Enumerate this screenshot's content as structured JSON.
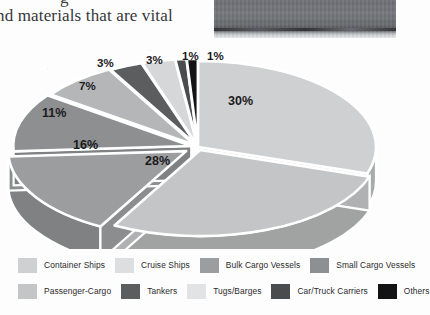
{
  "document": {
    "clipped_line_above": "g",
    "body_line": "nd materials that are vital"
  },
  "photo": {
    "alt_name": "grayscale-seascape-photo-fragment"
  },
  "chart_data": {
    "type": "pie",
    "title": "",
    "exploded": true,
    "three_d": true,
    "legend_position": "bottom",
    "categories": [
      "Container Ships",
      "Cruise Ships",
      "Bulk Cargo Vessels",
      "Small Cargo Vessels",
      "Passenger-Cargo",
      "Tankers",
      "Tugs/Barges",
      "Car/Truck Carriers",
      "Others"
    ],
    "values": [
      30,
      28,
      16,
      11,
      7,
      3,
      3,
      1,
      1
    ],
    "labels": [
      "30%",
      "28%",
      "16%",
      "11%",
      "7%",
      "3%",
      "3%",
      "1%",
      "1%"
    ],
    "colors": [
      "#cfd0d1",
      "#c4c5c6",
      "#9b9d9f",
      "#8d8f91",
      "#b4b6b8",
      "#5b5d5f",
      "#d6d7d8",
      "#4a4c4e",
      "#131315"
    ]
  },
  "legend": {
    "row1": [
      {
        "label": "Container Ships",
        "color": "#cfd0d1"
      },
      {
        "label": "Cruise Ships",
        "color": "#dddedf"
      },
      {
        "label": "Bulk Cargo Vessels",
        "color": "#9b9d9f"
      },
      {
        "label": "Small Cargo Vessels",
        "color": "#8d8f91"
      }
    ],
    "row2": [
      {
        "label": "Passenger-Cargo",
        "color": "#c4c5c6"
      },
      {
        "label": "Tankers",
        "color": "#5b5d5f"
      },
      {
        "label": "Tugs/Barges",
        "color": "#e2e3e4"
      },
      {
        "label": "Car/Truck Carriers",
        "color": "#4a4c4e"
      },
      {
        "label": "Others",
        "color": "#131315"
      }
    ]
  },
  "slice_label_positions": [
    {
      "text": "30%",
      "left": 228,
      "top": 50
    },
    {
      "text": "28%",
      "left": 145,
      "top": 110
    },
    {
      "text": "16%",
      "left": 73,
      "top": 94
    },
    {
      "text": "11%",
      "left": 42,
      "top": 62
    },
    {
      "text": "7%",
      "left": 79,
      "top": 36
    },
    {
      "text": "3%",
      "left": 97,
      "top": 13
    },
    {
      "text": "3%",
      "left": 146,
      "top": 10
    },
    {
      "text": "1%",
      "left": 182,
      "top": 6
    },
    {
      "text": "1%",
      "left": 207,
      "top": 6
    }
  ]
}
